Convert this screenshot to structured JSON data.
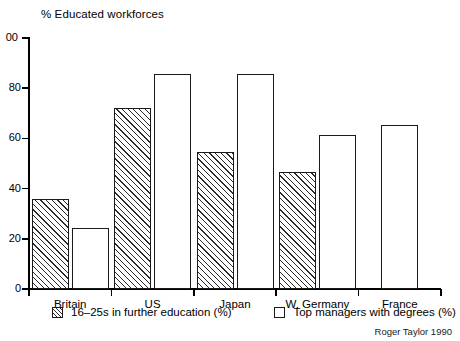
{
  "chart_data": {
    "type": "bar",
    "title": "% Educated workforces",
    "xlabel": "",
    "ylabel": "",
    "ylim": [
      0,
      100
    ],
    "yticks": [
      0,
      20,
      40,
      60,
      80,
      100
    ],
    "ytick_labels": [
      "0",
      "20",
      "40",
      "60",
      "80",
      "100"
    ],
    "ytick_label_top_clipped": "00",
    "grid": false,
    "legend_position": "below-axis",
    "categories": [
      "Britain",
      "US",
      "Japan",
      "W. Germany",
      "France"
    ],
    "series": [
      {
        "name": "16–25s in further education (%)",
        "style": "hatched",
        "values": [
          36,
          72,
          54.5,
          46.5,
          null
        ]
      },
      {
        "name": "Top managers with degrees (%)",
        "style": "open",
        "values": [
          24.5,
          85.5,
          85.5,
          61.5,
          65.5
        ]
      }
    ],
    "annotations": [
      "Roger Taylor 1990"
    ]
  },
  "legend": {
    "entries": [
      {
        "label": "16–25s in further education (%)",
        "swatch": "hatched-swatch"
      },
      {
        "label": "Top managers with degrees (%)",
        "swatch": "open-swatch"
      }
    ]
  },
  "credit": {
    "text": "Roger Taylor 1990"
  },
  "colors": {
    "ink": "#000000",
    "bar_outline": "#1a1a1a",
    "hatch": "#2a2a2a",
    "background": "#ffffff"
  }
}
